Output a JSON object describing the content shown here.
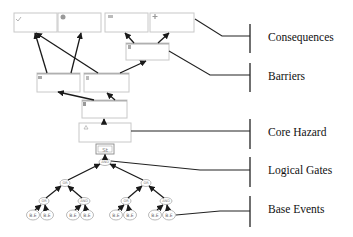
{
  "labels": {
    "consequences": "Consequences",
    "barriers": "Barriers",
    "core_hazard": "Core Hazard",
    "logical_gates": "Logical Gates",
    "base_events": "Base Events"
  },
  "consequence_boxes": [
    {
      "icon": "checkmark-icon"
    },
    {
      "icon": "globe-icon"
    },
    {
      "icon": "money-icon"
    },
    {
      "icon": "plus-icon"
    }
  ],
  "barrier_boxes": [
    {
      "icon": "barrier-icon"
    },
    {
      "icon": "barrier-icon"
    },
    {
      "icon": "barrier-icon"
    },
    {
      "icon": "barrier-icon"
    }
  ],
  "core_hazard": {
    "icon": "warning-triangle-icon"
  },
  "top_event_symbol": "St",
  "gates": {
    "top": "AND",
    "mid_left": "OR",
    "mid_right": "OR",
    "low": [
      "OR",
      "AND",
      "OR",
      "AND"
    ]
  },
  "base_event_label": "B.E",
  "base_event_count": 8,
  "colors": {
    "box_border": "#c8c8c8",
    "box_header": "#b0b0b0",
    "line": "#1a1a1a",
    "text": "#111111"
  }
}
